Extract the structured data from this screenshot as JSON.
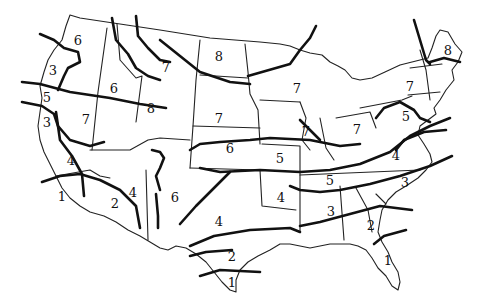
{
  "map": {
    "subject": "United States hand-drawn zone map",
    "zones": [
      {
        "label": "6",
        "x": 78,
        "y": 40
      },
      {
        "label": "3",
        "x": 53,
        "y": 70
      },
      {
        "label": "5",
        "x": 47,
        "y": 97
      },
      {
        "label": "3",
        "x": 47,
        "y": 122
      },
      {
        "label": "6",
        "x": 114,
        "y": 88
      },
      {
        "label": "7",
        "x": 166,
        "y": 67
      },
      {
        "label": "8",
        "x": 219,
        "y": 56
      },
      {
        "label": "8",
        "x": 151,
        "y": 108
      },
      {
        "label": "7",
        "x": 86,
        "y": 119
      },
      {
        "label": "7",
        "x": 219,
        "y": 118
      },
      {
        "label": "7",
        "x": 297,
        "y": 88
      },
      {
        "label": "7",
        "x": 306,
        "y": 131
      },
      {
        "label": "7",
        "x": 357,
        "y": 129
      },
      {
        "label": "7",
        "x": 410,
        "y": 86
      },
      {
        "label": "8",
        "x": 448,
        "y": 50
      },
      {
        "label": "5",
        "x": 406,
        "y": 116
      },
      {
        "label": "4",
        "x": 396,
        "y": 155
      },
      {
        "label": "6",
        "x": 230,
        "y": 148
      },
      {
        "label": "5",
        "x": 280,
        "y": 158
      },
      {
        "label": "5",
        "x": 330,
        "y": 180
      },
      {
        "label": "3",
        "x": 405,
        "y": 182
      },
      {
        "label": "4",
        "x": 71,
        "y": 160
      },
      {
        "label": "1",
        "x": 62,
        "y": 196
      },
      {
        "label": "2",
        "x": 115,
        "y": 203
      },
      {
        "label": "4",
        "x": 133,
        "y": 192
      },
      {
        "label": "6",
        "x": 175,
        "y": 197
      },
      {
        "label": "4",
        "x": 219,
        "y": 221
      },
      {
        "label": "4",
        "x": 281,
        "y": 197
      },
      {
        "label": "3",
        "x": 331,
        "y": 211
      },
      {
        "label": "2",
        "x": 371,
        "y": 225
      },
      {
        "label": "2",
        "x": 232,
        "y": 256
      },
      {
        "label": "1",
        "x": 232,
        "y": 282
      },
      {
        "label": "1",
        "x": 388,
        "y": 260
      }
    ]
  }
}
